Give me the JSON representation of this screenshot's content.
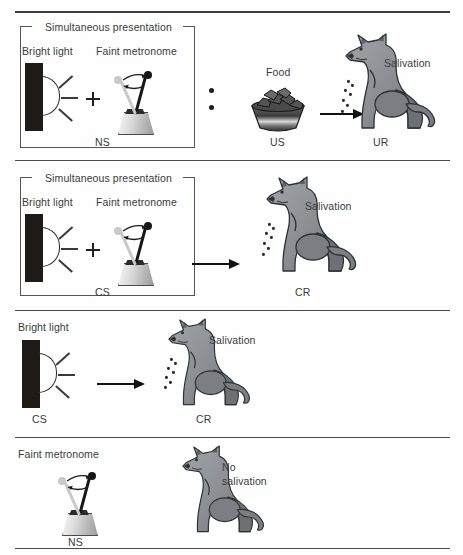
{
  "figure": {
    "background": "#fefefe",
    "ink": "#3b3b3b"
  },
  "panels": [
    {
      "id": "panel-acquisition-before",
      "bracket_label": "Simultaneous presentation",
      "stimuli": [
        {
          "name": "bright-light",
          "label": "Bright light"
        },
        {
          "name": "plus-sign",
          "label": "+"
        },
        {
          "name": "faint-metronome",
          "label": "Faint metronome"
        }
      ],
      "bracket_code": "NS",
      "separator": "colon-dots",
      "food": {
        "label": "Food",
        "code": "US"
      },
      "arrow": "rightwards-arrow",
      "dog": {
        "response_label": "Salivation",
        "code": "UR",
        "salivating": true
      }
    },
    {
      "id": "panel-acquisition-after",
      "bracket_label": "Simultaneous presentation",
      "stimuli": [
        {
          "name": "bright-light",
          "label": "Bright light"
        },
        {
          "name": "plus-sign",
          "label": "+"
        },
        {
          "name": "faint-metronome",
          "label": "Faint metronome"
        }
      ],
      "bracket_code": "CS",
      "arrow": "rightwards-arrow",
      "dog": {
        "response_label": "Salivation",
        "code": "CR",
        "salivating": true
      }
    },
    {
      "id": "panel-light-alone",
      "stimulus": {
        "name": "bright-light",
        "label": "Bright light",
        "code": "CS"
      },
      "arrow": "rightwards-arrow",
      "dog": {
        "response_label": "Salivation",
        "code": "CR",
        "salivating": true
      }
    },
    {
      "id": "panel-metronome-alone",
      "stimulus": {
        "name": "faint-metronome",
        "label": "Faint metronome",
        "code": "NS"
      },
      "dog": {
        "response_label_line1": "No",
        "response_label_line2": "salivation",
        "salivating": false
      }
    }
  ],
  "colors": {
    "rule": "#4a4a4a",
    "lamp_body": "#1d1a18",
    "dog_body": "#8e9195",
    "dog_shade": "#6e7175",
    "arrow": "#111111",
    "metronome_rod": "#171717",
    "metronome_ghost": "#c9c9c9"
  }
}
